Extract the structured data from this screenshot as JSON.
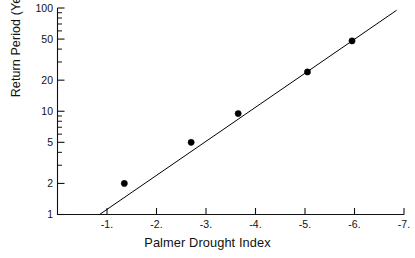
{
  "chart_data": {
    "type": "scatter",
    "title": "",
    "xlabel": "Palmer Drought Index",
    "ylabel": "Return Period (Years)",
    "xlim": [
      0.0,
      -7.0
    ],
    "ylim": [
      1,
      100
    ],
    "yscale": "log",
    "xscale": "linear",
    "grid": false,
    "legend": null,
    "x_major_ticks": [
      -1,
      -2,
      -3,
      -4,
      -5,
      -6,
      -7
    ],
    "x_tick_labels": [
      "-1.",
      "-2.",
      "-3.",
      "-4.",
      "-5.",
      "-6.",
      "-7."
    ],
    "y_major_ticks": [
      1,
      2,
      5,
      10,
      20,
      50,
      100
    ],
    "y_tick_labels": [
      "1",
      "2",
      "5",
      "10",
      "20",
      "50",
      "100"
    ],
    "y_minor_ticks": [
      3,
      4,
      6,
      7,
      8,
      9,
      30,
      40,
      60,
      70,
      80,
      90
    ],
    "points": [
      {
        "x": -1.35,
        "y": 2.0
      },
      {
        "x": -2.7,
        "y": 5.0
      },
      {
        "x": -3.65,
        "y": 9.5
      },
      {
        "x": -5.05,
        "y": 24.0
      },
      {
        "x": -5.95,
        "y": 48.0
      }
    ],
    "fit_line": {
      "description": "straight regression line on semi-log axes",
      "start": {
        "x": -0.85,
        "y": 1.0
      },
      "end": {
        "x": -6.85,
        "y": 95.0
      }
    },
    "marker": {
      "shape": "filled-circle",
      "color": "#000000",
      "size": 4
    },
    "line": {
      "color": "#000000",
      "width": 1
    }
  },
  "axis": {
    "x_title": "Palmer Drought Index",
    "y_title": "Return Period (Years)"
  },
  "colors": {
    "ink": "#111111",
    "background": "#ffffff",
    "marker": "#000000",
    "line": "#000000"
  }
}
